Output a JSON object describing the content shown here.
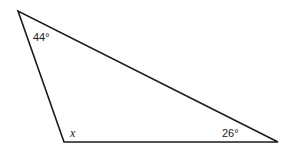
{
  "figure": {
    "type": "triangle",
    "vertices": {
      "top": [
        18,
        11
      ],
      "bottom_left": [
        64,
        142
      ],
      "bottom_right": [
        278,
        142
      ]
    },
    "stroke_color": "#1a1a1a",
    "angles": {
      "top": {
        "label": "44°",
        "pos": [
          33,
          41
        ]
      },
      "bottom_left": {
        "label": "x",
        "pos": [
          70,
          137
        ]
      },
      "bottom_right": {
        "label": "26°",
        "pos": [
          222,
          137
        ]
      }
    }
  }
}
